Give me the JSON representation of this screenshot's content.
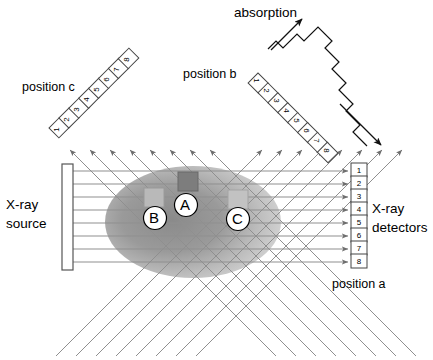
{
  "figure": {
    "title_absorption": "absorption",
    "source_label_line1": "X-ray",
    "source_label_line2": "source",
    "detectors_label_line1": "X-ray",
    "detectors_label_line2": "detectors",
    "position_a": "position a",
    "position_b": "position b",
    "position_c": "position c"
  },
  "colors": {
    "ink": "#000000",
    "ray": "#8c8c8c",
    "ray_dark": "#6e6e6e",
    "object_dark": "#8a8a8a",
    "object_light": "#c9c9c9",
    "inclusion_a": "#7a7a7a",
    "inclusion_b": "#b5b5b5",
    "inclusion_c": "#bdbdbd",
    "background": "#ffffff"
  },
  "detector_arrays": {
    "position_a": {
      "orientation": "vertical",
      "label": "position a",
      "cells": [
        "1",
        "2",
        "3",
        "4",
        "5",
        "6",
        "7",
        "8"
      ]
    },
    "position_b": {
      "orientation": "diagonal-down-right",
      "label": "position b",
      "cells": [
        "1",
        "2",
        "3",
        "4",
        "5",
        "6",
        "7",
        "8"
      ]
    },
    "position_c": {
      "orientation": "diagonal-up-right",
      "label": "position c",
      "cells": [
        "1",
        "2",
        "3",
        "4",
        "5",
        "6",
        "7",
        "8"
      ]
    }
  },
  "inclusions": [
    {
      "id": "A",
      "label": "A",
      "shade": "dark"
    },
    {
      "id": "B",
      "label": "B",
      "shade": "light"
    },
    {
      "id": "C",
      "label": "C",
      "shade": "light"
    }
  ],
  "absorption_profile": {
    "axis_label": "absorption",
    "steps": [
      2,
      7,
      3,
      9,
      5,
      14,
      6,
      12
    ]
  },
  "beams": {
    "horizontal_count": 8,
    "diagonal_up_right_count": 8,
    "diagonal_up_left_count": 8
  }
}
